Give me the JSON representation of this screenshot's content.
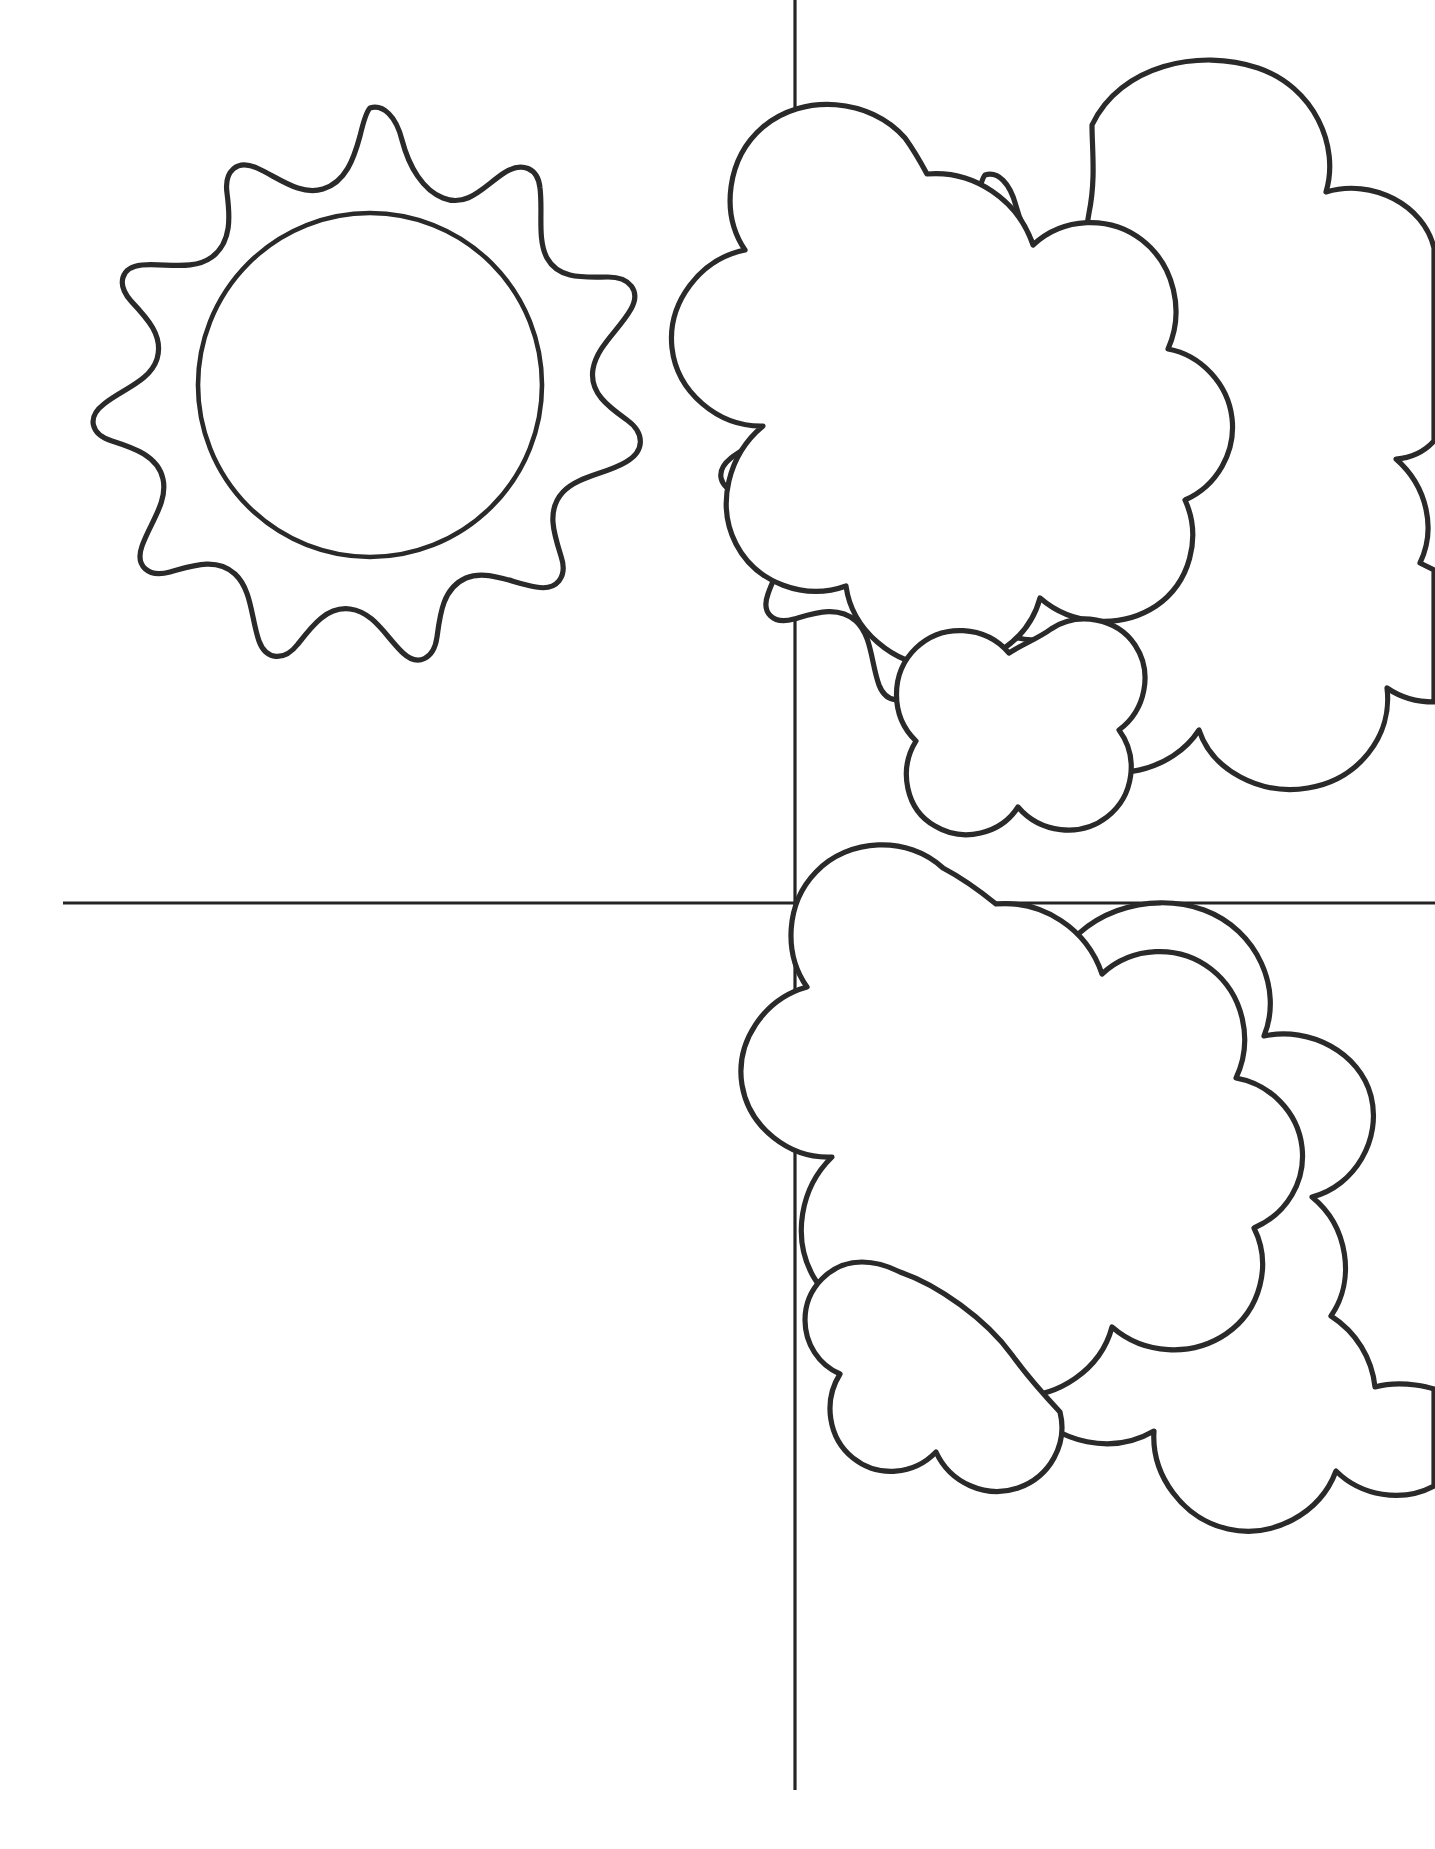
{
  "page": {
    "width": 1435,
    "height": 1849,
    "background_color": "#ffffff",
    "ink_color": "#2a2a2a",
    "style": "black-and-white line art coloring page",
    "text_content": "none"
  },
  "layout": {
    "type": "four-quadrant-grid",
    "divider": {
      "name": "crosshair-divider",
      "color": "#242424",
      "stroke_width": 3.2,
      "vertical_line": {
        "x": 795,
        "y_start": 0,
        "y_end": 1790
      },
      "horizontal_line": {
        "y": 903,
        "x_start": 63,
        "x_end": 1435
      }
    },
    "quadrants": [
      {
        "id": "top-left",
        "label": "Sun",
        "content": "sun-with-rays",
        "empty": false
      },
      {
        "id": "top-right",
        "label": "Sun Behind Clouds",
        "content": "sun-behind-clouds",
        "empty": false
      },
      {
        "id": "bottom-left",
        "label": "Blank",
        "content": "empty",
        "empty": true
      },
      {
        "id": "bottom-right",
        "label": "Clouds",
        "content": "clouds",
        "empty": false
      }
    ]
  },
  "figures": {
    "sun_top_left": {
      "name": "sun-figure",
      "center": {
        "x": 370,
        "y": 380
      },
      "inner_circle_radius": 172,
      "ray_count": 13,
      "ray_outer_radius": 272,
      "ray_valley_radius": 196,
      "description": "Sun with scalloped wavy rays and a plain inner circle"
    },
    "sun_top_right": {
      "name": "sun-behind-clouds-figure",
      "center": {
        "x": 985,
        "y": 430
      },
      "inner_circle_radius": 160,
      "ray_count": 13,
      "ray_outer_radius": 255,
      "ray_valley_radius": 185,
      "description": "Sun partly hidden behind a cluster of puffy clouds"
    },
    "clouds_top_right": {
      "name": "cloud-cluster-top",
      "puff_count": 13,
      "bounds": {
        "x": 735,
        "y": 55,
        "width": 700,
        "height": 680
      },
      "description": "Two overlapping billowing cumulus cloud masses"
    },
    "clouds_bottom_right": {
      "name": "cloud-cluster-bottom",
      "puff_count": 13,
      "bounds": {
        "x": 780,
        "y": 835,
        "width": 655,
        "height": 640
      },
      "description": "Two overlapping billowing cumulus cloud masses"
    }
  }
}
